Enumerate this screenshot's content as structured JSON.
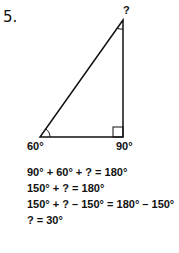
{
  "problem_number": "5.",
  "diagram": {
    "type": "right-triangle",
    "vertices": {
      "top": {
        "label": "?"
      },
      "bottom_left": {
        "label": "60°"
      },
      "bottom_right": {
        "label": "90°"
      }
    }
  },
  "equations": [
    "90° + 60° + ? = 180°",
    "150° + ? = 180°",
    "150° + ? – 150° = 180° – 150°",
    "? = 30°"
  ]
}
